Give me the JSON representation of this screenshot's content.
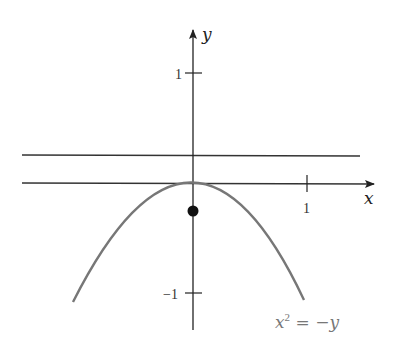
{
  "diagram": {
    "axes": {
      "x_label": "x",
      "y_label": "y",
      "x_ticks": [
        {
          "value": 1,
          "label": "1"
        }
      ],
      "y_ticks": [
        {
          "value": 1,
          "label": "1"
        },
        {
          "value": -1,
          "label": "−1"
        }
      ]
    },
    "curve": {
      "equation_label_base": "x",
      "equation_label_exp": "2",
      "equation_label_rest": " = −y",
      "equation": "x^2 = -y",
      "color": "#777777"
    },
    "horizontal_lines": [
      {
        "name": "upper-line",
        "y_value": 0.25
      },
      {
        "name": "tangent-line",
        "y_value": 0
      }
    ],
    "point": {
      "x": 0,
      "y": -0.25,
      "description": "focus"
    },
    "colors": {
      "axis": "#222222",
      "curve": "#777777",
      "label_curve": "#777777"
    }
  }
}
